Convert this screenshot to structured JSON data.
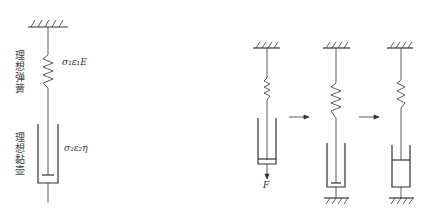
{
  "figure": {
    "left_model": {
      "spring_label": "理想弹簧",
      "spring_formula": "σ₁ε₁E",
      "dashpot_label": "理想黏壶",
      "dashpot_formula": "σ₂ε₂η"
    },
    "sequence": {
      "stage1_force_label": "F",
      "arrows": [
        "→",
        "→"
      ]
    },
    "colors": {
      "line": "#333333",
      "text": "#444444"
    }
  }
}
